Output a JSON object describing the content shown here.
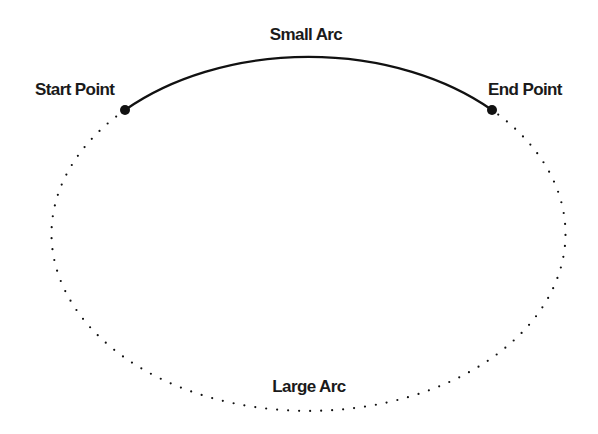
{
  "diagram": {
    "labels": {
      "small_arc": "Small Arc",
      "large_arc": "Large Arc",
      "start_point": "Start Point",
      "end_point": "End Point"
    },
    "ellipse": {
      "cx": 308,
      "cy": 234,
      "rx": 257,
      "ry": 177
    },
    "start_point": {
      "x": 125,
      "y": 110
    },
    "end_point": {
      "x": 492,
      "y": 110
    },
    "colors": {
      "stroke": "#111111",
      "text": "#1a1a1a"
    }
  }
}
